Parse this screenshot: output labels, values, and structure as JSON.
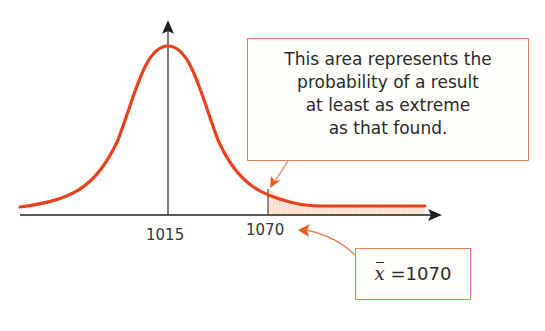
{
  "diagram": {
    "axes": {
      "x_axis_arrow": true,
      "y_axis_arrow": true
    },
    "tick_labels": [
      {
        "id": "mean",
        "label": "1015"
      },
      {
        "id": "observed",
        "label": "1070"
      }
    ],
    "callouts": {
      "area": {
        "lines": [
          "This area represents the",
          "probability of a result",
          "at least as extreme",
          "as that found."
        ]
      },
      "sample_mean": {
        "symbol": "x",
        "text": " =1070"
      }
    },
    "colors": {
      "curve": "#e8411e",
      "axis": "#222222",
      "callout_border": "#e8805a",
      "shaded_area": "#fbdccb",
      "arrow": "#e85a2a"
    }
  }
}
